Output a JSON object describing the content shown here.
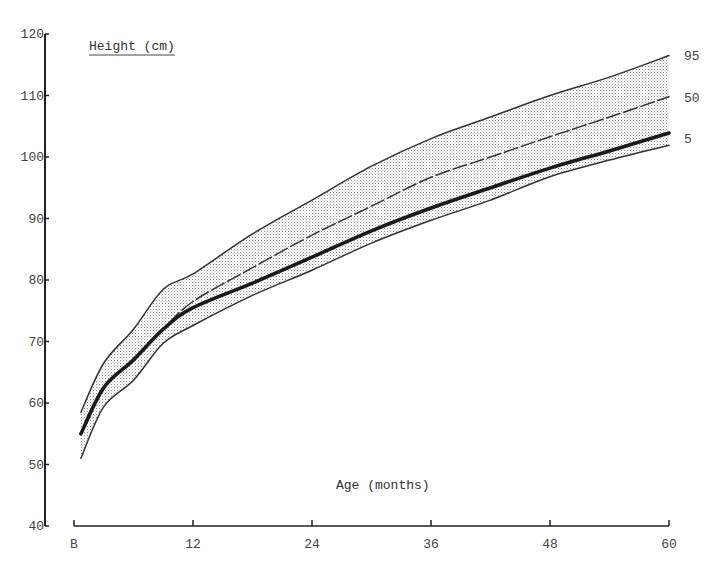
{
  "chart_data": {
    "type": "line",
    "title": "Height (cm)",
    "xlabel": "Age (months)",
    "ylabel": "Height (cm)",
    "x_ticks": [
      {
        "value": 0,
        "label": "B"
      },
      {
        "value": 12,
        "label": "12"
      },
      {
        "value": 24,
        "label": "24"
      },
      {
        "value": 36,
        "label": "36"
      },
      {
        "value": 48,
        "label": "48"
      },
      {
        "value": 60,
        "label": "60"
      }
    ],
    "y_ticks": [
      40,
      50,
      60,
      70,
      80,
      90,
      100,
      110,
      120
    ],
    "xlim": [
      0,
      60
    ],
    "ylim": [
      40,
      120
    ],
    "grid": false,
    "legend": "inline labels at right end of curves",
    "x": [
      0.7,
      3,
      6,
      9,
      12,
      18,
      24,
      30,
      36,
      42,
      48,
      54,
      60
    ],
    "series": [
      {
        "name": "95",
        "style": "thin-solid",
        "role": "upper-band-edge",
        "values": [
          58.5,
          66.5,
          72.0,
          78.5,
          81.0,
          87.5,
          93.0,
          98.5,
          103.0,
          106.5,
          110.0,
          113.0,
          116.5
        ]
      },
      {
        "name": "50",
        "style": "dashed",
        "values": [
          55.0,
          62.5,
          67.0,
          72.0,
          76.5,
          82.0,
          87.3,
          92.0,
          96.7,
          100.0,
          103.3,
          106.5,
          109.8
        ]
      },
      {
        "name": "",
        "style": "thick-solid",
        "values": [
          55.0,
          62.5,
          67.0,
          72.0,
          75.5,
          79.5,
          83.7,
          88.0,
          91.7,
          95.0,
          98.2,
          101.0,
          103.9
        ]
      },
      {
        "name": "5",
        "style": "thin-solid",
        "role": "lower-band-edge",
        "values": [
          51.0,
          59.4,
          63.7,
          69.7,
          72.6,
          77.5,
          81.6,
          86.0,
          89.7,
          93.0,
          96.8,
          99.5,
          101.9
        ]
      }
    ],
    "band": {
      "between": [
        "95",
        "5"
      ],
      "fill": "stippled"
    },
    "series_labels": [
      {
        "text": "95",
        "y": 116.5
      },
      {
        "text": "50",
        "y": 109.6
      },
      {
        "text": "5",
        "y": 103.0
      }
    ]
  },
  "colors": {
    "line": "#333333",
    "axis": "#222222",
    "stipple": "#9a9a9a",
    "text": "#444444"
  }
}
